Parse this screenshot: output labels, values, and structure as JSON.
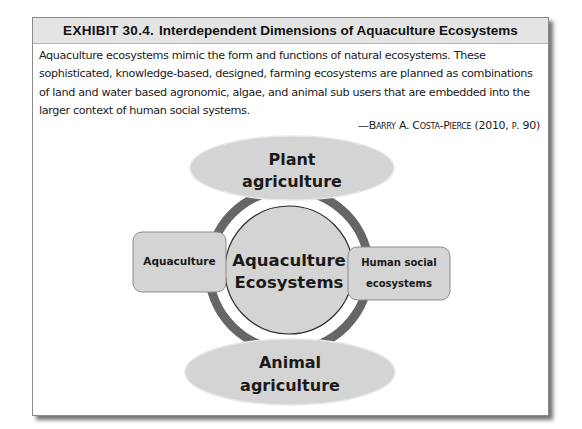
{
  "exhibit": {
    "number": "EXHIBIT 30.4.",
    "title": "Interdependent Dimensions of Aquaculture Ecosystems",
    "quote": "Aquaculture ecosystems mimic the form and functions of natural ecosystems. These sophisticated, knowledge-based, designed, farming ecosystems are planned as combinations of land and water based agronomic, algae, and animal sub users that are embedded into the larger context of human social systems.",
    "attribution": "—Barry A. Costa-Pierce (2010, p. 90)"
  },
  "diagram": {
    "center": {
      "line1": "Aquaculture",
      "line2": "Ecosystems"
    },
    "top": {
      "line1": "Plant",
      "line2": "agriculture"
    },
    "bottom": {
      "line1": "Animal",
      "line2": "agriculture"
    },
    "left": {
      "label": "Aquaculture"
    },
    "right": {
      "line1": "Human social",
      "line2": "ecosystems"
    },
    "colors": {
      "shape_fill": "#d4d4d4",
      "ring": "#666666",
      "outline": "#8c8c8c",
      "text": "#1a1a1a"
    }
  }
}
